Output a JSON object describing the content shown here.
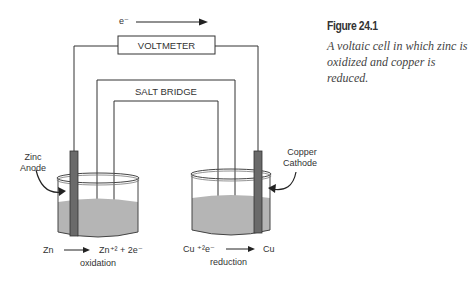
{
  "figure": {
    "title": "Figure 24.1",
    "caption": "A voltaic cell in which zinc is oxidized and copper is reduced."
  },
  "diagram": {
    "electron_label": "e⁻",
    "voltmeter_label": "VOLTMETER",
    "salt_bridge_label": "SALT BRIDGE",
    "anode_label_1": "Zinc",
    "anode_label_2": "Anode",
    "cathode_label_1": "Copper",
    "cathode_label_2": "Cathode",
    "left_reaction_reactant": "Zn",
    "left_reaction_product": "Zn⁺² + 2e⁻",
    "left_reaction_type": "oxidation",
    "right_reaction_reactant": "Cu ⁺²e⁻",
    "right_reaction_product": "Cu",
    "right_reaction_type": "reduction"
  },
  "colors": {
    "liquid": "#b0b0b0",
    "rod": "#6a6a6a",
    "line": "#333333"
  }
}
